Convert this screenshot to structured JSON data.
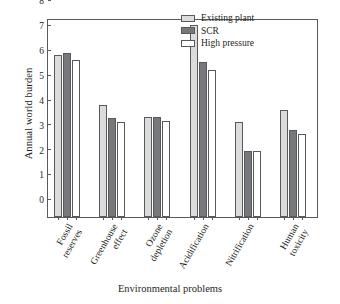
{
  "chart_data": {
    "type": "bar",
    "title": "",
    "xlabel": "Environmental problems",
    "ylabel": "Annual world burden",
    "ylim": [
      0,
      8
    ],
    "yticks": [
      "0",
      "1",
      "2",
      "3",
      "4",
      "5",
      "6",
      "7",
      "8"
    ],
    "grid": false,
    "legend_position": "top-right",
    "categories": [
      "Fossil\nreserves",
      "Greenhouse\neffect",
      "Ozone\ndepletion",
      "Acidification",
      "Nitrification",
      "Human\ntoxicity"
    ],
    "series": [
      {
        "name": "Existing plant",
        "color": "#dcdcdc",
        "values": [
          6.52,
          4.5,
          4.03,
          7.72,
          3.83,
          4.32
        ]
      },
      {
        "name": "SCR",
        "color": "#77787b",
        "values": [
          6.6,
          3.98,
          4.03,
          6.23,
          2.65,
          3.5
        ]
      },
      {
        "name": "High pressure",
        "color": "#ffffff",
        "values": [
          6.3,
          3.8,
          3.84,
          5.92,
          2.66,
          3.34
        ]
      }
    ]
  },
  "axis": {
    "frame_color": "#58595b"
  }
}
